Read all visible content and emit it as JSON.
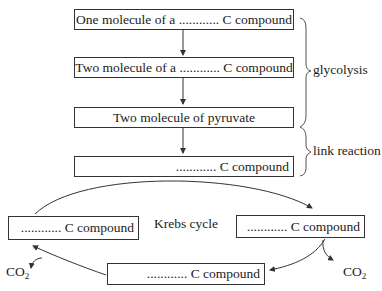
{
  "diagram": {
    "linear_steps": [
      {
        "text": "One molecule of a ............ C compound"
      },
      {
        "text": "Two molecule of a ............ C compound"
      },
      {
        "text": "Two molecule of pyruvate"
      },
      {
        "text": "............ C compound"
      }
    ],
    "braces": [
      {
        "label": "glycolysis"
      },
      {
        "label": "link reaction"
      }
    ],
    "cycle": {
      "label": "Krebs cycle",
      "nodes": [
        {
          "position": "left",
          "text": "............ C compound"
        },
        {
          "position": "right",
          "text": "............ C compound"
        },
        {
          "position": "bottom",
          "text": "............ C compound"
        }
      ],
      "outputs": [
        {
          "position": "left",
          "text": "CO",
          "sub": "2"
        },
        {
          "position": "right",
          "text": "CO",
          "sub": "2"
        }
      ]
    }
  }
}
